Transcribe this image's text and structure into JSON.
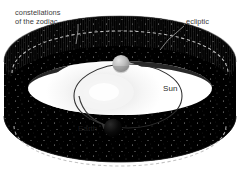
{
  "figure": {
    "type": "astronomy-diagram",
    "background_color": "#ffffff"
  },
  "labels": {
    "zodiac_line1": "constellations",
    "zodiac_line2": "of the zodiac",
    "ecliptic": "ecliptic",
    "sun": "Sun",
    "earth": "Earth"
  },
  "colors": {
    "band_dark": "#000000",
    "band_mid": "#121212",
    "band_face": "#1a1a1a",
    "star": "#d9d9d9",
    "dashed_ecliptic": "#c9c9c9",
    "orbit_line": "#2a2a2a",
    "sun_glow": "#f2f2f2",
    "earth_body": "#060606",
    "moon_body": "#b4b4b4",
    "label_text": "#3b3b3b",
    "leader_line": "#8a8a8a"
  },
  "elements": {
    "band_name": "zodiac-constellation-band",
    "ecliptic_name": "ecliptic-dashed-line",
    "orbit_name": "earth-orbit-ellipse",
    "sun_name": "sun-glow",
    "earth_name": "earth-sphere",
    "moon_name": "moon-sphere",
    "arrow_name": "orbit-direction-arrow"
  }
}
